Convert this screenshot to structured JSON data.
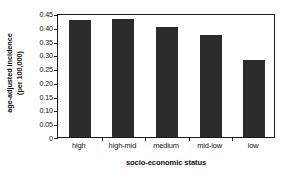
{
  "chart_data": {
    "type": "bar",
    "title": "",
    "categories": [
      "high",
      "high-mid",
      "medium",
      "mid-low",
      "low"
    ],
    "values": [
      0.423,
      0.427,
      0.398,
      0.37,
      0.28
    ],
    "series": [
      {
        "name": "age-adjusted incidence (per 100,000)",
        "values": [
          0.423,
          0.427,
          0.398,
          0.37,
          0.28
        ]
      }
    ],
    "xlabel": "socio-economic status",
    "ylabel_line1": "age-adjusted incidence",
    "ylabel_line2": "(per 100,000)",
    "ylabel": "age-adjusted incidence (per 100,000)",
    "ylim": [
      0,
      0.45
    ],
    "yticks": [
      0,
      0.05,
      0.1,
      0.15,
      0.2,
      0.25,
      0.3,
      0.35,
      0.4,
      0.45
    ],
    "ytick_labels": [
      "0",
      "0.05",
      "0.10",
      "0.15",
      "0.20",
      "0.25",
      "0.30",
      "0.35",
      "0.40",
      "0.45"
    ],
    "grid": false,
    "legend": false,
    "legend_position": "none",
    "bar_color": "#2b2b2b",
    "axis_color": "#1b1b1b",
    "background_color": "#ffffff"
  }
}
